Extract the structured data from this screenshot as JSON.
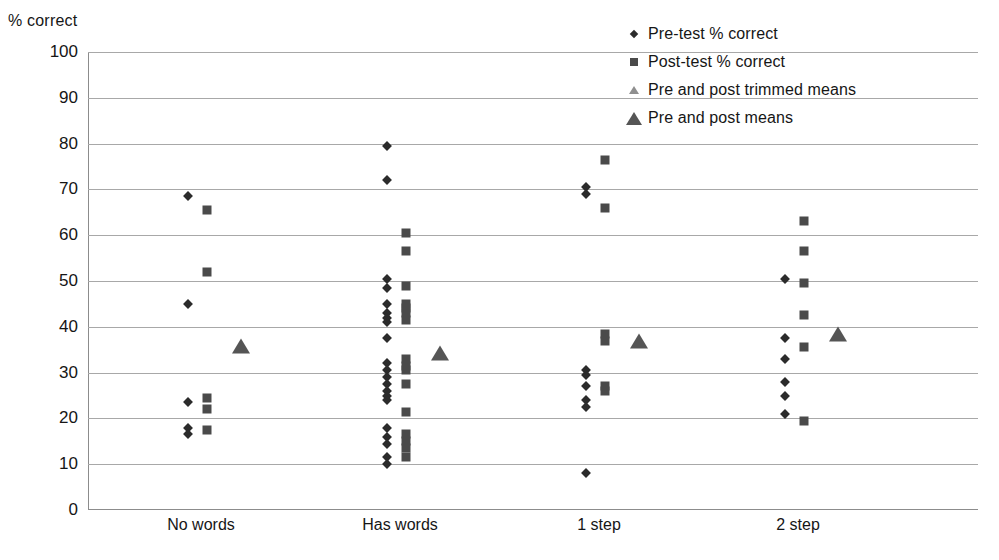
{
  "chart_data": {
    "type": "scatter",
    "title": "",
    "ylabel": "% correct",
    "xlabel": "",
    "ylim": [
      0,
      100
    ],
    "ytick_step": 10,
    "grid": true,
    "legend_position": "top-right",
    "yticks": [
      "100",
      "90",
      "80",
      "70",
      "60",
      "50",
      "40",
      "30",
      "20",
      "10",
      "0"
    ],
    "categories": [
      "No words",
      "Has words",
      "1 step",
      "2 step"
    ],
    "legend": [
      {
        "marker": "diamond-icon",
        "label": "Pre-test % correct"
      },
      {
        "marker": "square-icon",
        "label": "Post-test % correct"
      },
      {
        "marker": "triangle-small-icon",
        "label": "Pre and post trimmed means"
      },
      {
        "marker": "triangle-large-icon",
        "label": "Pre and post means"
      }
    ],
    "series": [
      {
        "name": "Pre-test % correct",
        "marker": "diamond",
        "points": [
          {
            "category": "No words",
            "value": 68.5
          },
          {
            "category": "No words",
            "value": 45
          },
          {
            "category": "No words",
            "value": 23.5
          },
          {
            "category": "No words",
            "value": 18
          },
          {
            "category": "No words",
            "value": 16.5
          },
          {
            "category": "Has words",
            "value": 79.5
          },
          {
            "category": "Has words",
            "value": 72
          },
          {
            "category": "Has words",
            "value": 50.5
          },
          {
            "category": "Has words",
            "value": 48.5
          },
          {
            "category": "Has words",
            "value": 45
          },
          {
            "category": "Has words",
            "value": 43
          },
          {
            "category": "Has words",
            "value": 42
          },
          {
            "category": "Has words",
            "value": 41
          },
          {
            "category": "Has words",
            "value": 37.5
          },
          {
            "category": "Has words",
            "value": 32
          },
          {
            "category": "Has words",
            "value": 30.5
          },
          {
            "category": "Has words",
            "value": 29
          },
          {
            "category": "Has words",
            "value": 27.5
          },
          {
            "category": "Has words",
            "value": 26
          },
          {
            "category": "Has words",
            "value": 25
          },
          {
            "category": "Has words",
            "value": 24
          },
          {
            "category": "Has words",
            "value": 18
          },
          {
            "category": "Has words",
            "value": 16
          },
          {
            "category": "Has words",
            "value": 14.5
          },
          {
            "category": "Has words",
            "value": 11.5
          },
          {
            "category": "Has words",
            "value": 10
          },
          {
            "category": "1 step",
            "value": 70.5
          },
          {
            "category": "1 step",
            "value": 69
          },
          {
            "category": "1 step",
            "value": 30.5
          },
          {
            "category": "1 step",
            "value": 29.5
          },
          {
            "category": "1 step",
            "value": 27
          },
          {
            "category": "1 step",
            "value": 24
          },
          {
            "category": "1 step",
            "value": 22.5
          },
          {
            "category": "1 step",
            "value": 8
          },
          {
            "category": "2 step",
            "value": 50.5
          },
          {
            "category": "2 step",
            "value": 37.5
          },
          {
            "category": "2 step",
            "value": 33
          },
          {
            "category": "2 step",
            "value": 28
          },
          {
            "category": "2 step",
            "value": 25
          },
          {
            "category": "2 step",
            "value": 21
          }
        ]
      },
      {
        "name": "Post-test % correct",
        "marker": "square",
        "points": [
          {
            "category": "No words",
            "value": 65.5
          },
          {
            "category": "No words",
            "value": 52
          },
          {
            "category": "No words",
            "value": 24.5
          },
          {
            "category": "No words",
            "value": 22
          },
          {
            "category": "No words",
            "value": 17.5
          },
          {
            "category": "Has words",
            "value": 60.5
          },
          {
            "category": "Has words",
            "value": 56.5
          },
          {
            "category": "Has words",
            "value": 49
          },
          {
            "category": "Has words",
            "value": 45
          },
          {
            "category": "Has words",
            "value": 44
          },
          {
            "category": "Has words",
            "value": 43
          },
          {
            "category": "Has words",
            "value": 41.5
          },
          {
            "category": "Has words",
            "value": 33
          },
          {
            "category": "Has words",
            "value": 31.5
          },
          {
            "category": "Has words",
            "value": 30.5
          },
          {
            "category": "Has words",
            "value": 27.5
          },
          {
            "category": "Has words",
            "value": 21.5
          },
          {
            "category": "Has words",
            "value": 16.5
          },
          {
            "category": "Has words",
            "value": 15
          },
          {
            "category": "Has words",
            "value": 13.5
          },
          {
            "category": "Has words",
            "value": 11.5
          },
          {
            "category": "1 step",
            "value": 76.5
          },
          {
            "category": "1 step",
            "value": 66
          },
          {
            "category": "1 step",
            "value": 38.5
          },
          {
            "category": "1 step",
            "value": 37
          },
          {
            "category": "1 step",
            "value": 27
          },
          {
            "category": "1 step",
            "value": 26
          },
          {
            "category": "2 step",
            "value": 63
          },
          {
            "category": "2 step",
            "value": 56.5
          },
          {
            "category": "2 step",
            "value": 49.5
          },
          {
            "category": "2 step",
            "value": 42.5
          },
          {
            "category": "2 step",
            "value": 35.5
          },
          {
            "category": "2 step",
            "value": 19.5
          }
        ]
      },
      {
        "name": "Pre and post trimmed means",
        "marker": "triangle-small",
        "points": []
      },
      {
        "name": "Pre and post means",
        "marker": "triangle-large",
        "points": [
          {
            "category": "No words",
            "value": 35.7
          },
          {
            "category": "Has words",
            "value": 34.3
          },
          {
            "category": "1 step",
            "value": 37
          },
          {
            "category": "2 step",
            "value": 38.5
          }
        ]
      }
    ]
  }
}
